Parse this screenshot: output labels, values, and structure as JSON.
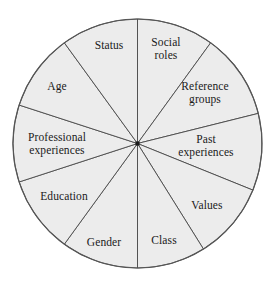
{
  "diagram": {
    "shape": "circle",
    "fill_color": "#ececec",
    "stroke_color": "#4a4a4a",
    "outer_stroke_color": "#555555",
    "center_dot_color": "#1a1a1a",
    "background_color": "#ffffff",
    "geometry": {
      "cx": 137.5,
      "cy": 143.5,
      "r": 124.5
    },
    "sectors": [
      {
        "id": "social-roles",
        "label": "Social\nroles",
        "start_angle": -90,
        "end_angle": -54,
        "label_x": 166,
        "label_y": 48
      },
      {
        "id": "reference-groups",
        "label": "Reference\ngroups",
        "start_angle": -54,
        "end_angle": -14,
        "label_x": 205,
        "label_y": 92
      },
      {
        "id": "past-experiences",
        "label": "Past\nexperiences",
        "start_angle": -14,
        "end_angle": 22,
        "label_x": 206,
        "label_y": 145
      },
      {
        "id": "values",
        "label": "Values",
        "start_angle": 22,
        "end_angle": 58,
        "label_x": 207,
        "label_y": 205
      },
      {
        "id": "class",
        "label": "Class",
        "start_angle": 58,
        "end_angle": 90,
        "label_x": 164,
        "label_y": 240
      },
      {
        "id": "gender",
        "label": "Gender",
        "start_angle": 90,
        "end_angle": 126,
        "label_x": 104,
        "label_y": 242
      },
      {
        "id": "education",
        "label": "Education",
        "start_angle": 126,
        "end_angle": 162,
        "label_x": 64,
        "label_y": 196
      },
      {
        "id": "professional-experiences",
        "label": "Professional\nexperiences",
        "start_angle": 162,
        "end_angle": 198,
        "label_x": 57,
        "label_y": 143
      },
      {
        "id": "age",
        "label": "Age",
        "start_angle": 198,
        "end_angle": 234,
        "label_x": 57,
        "label_y": 86
      },
      {
        "id": "status",
        "label": "Status",
        "start_angle": 234,
        "end_angle": 270,
        "label_x": 109,
        "label_y": 45
      }
    ]
  }
}
